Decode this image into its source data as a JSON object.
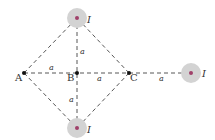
{
  "diagram": {
    "type": "geometry-current-wires",
    "points": [
      {
        "id": "A",
        "label": "A"
      },
      {
        "id": "B",
        "label": "B"
      },
      {
        "id": "C",
        "label": "C"
      }
    ],
    "wires": [
      {
        "id": "top",
        "current_label": "I",
        "direction": "out-of-page"
      },
      {
        "id": "bottom",
        "current_label": "I",
        "direction": "out-of-page"
      },
      {
        "id": "right",
        "current_label": "I",
        "direction": "out-of-page"
      }
    ],
    "distances": {
      "A_B": "a",
      "B_C": "a",
      "C_right": "a",
      "B_top": "a",
      "B_bottom": "a"
    },
    "colors": {
      "line": "#444444",
      "wire_fill": "#d3d3d3",
      "wire_dot": "#a0406a",
      "text": "#333333"
    }
  }
}
